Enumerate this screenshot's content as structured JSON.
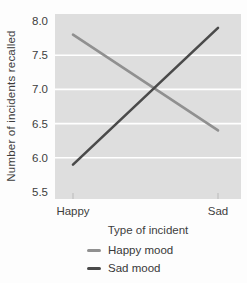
{
  "colors": {
    "plot_background": "#dedede",
    "gridline": "#ffffff",
    "axis_tick_mark": "#c6c6c6",
    "text": "#3d3d3d",
    "happy_mood_line": "#909090",
    "sad_mood_line": "#4a4a4a"
  },
  "chart_data": {
    "type": "line",
    "title": "",
    "xlabel": "Type of incident",
    "ylabel": "Number of incidents recalled",
    "categories": [
      "Happy",
      "Sad"
    ],
    "series": [
      {
        "name": "Happy mood",
        "values": [
          7.8,
          6.4
        ],
        "color": "#909090"
      },
      {
        "name": "Sad mood",
        "values": [
          5.9,
          7.9
        ],
        "color": "#4a4a4a"
      }
    ],
    "ylim": [
      5.5,
      8.0
    ],
    "yticks": [
      5.5,
      6.0,
      6.5,
      7.0,
      7.5,
      8.0
    ],
    "ytick_format_decimals": 1,
    "grid": true,
    "legend_position": "bottom-left"
  }
}
